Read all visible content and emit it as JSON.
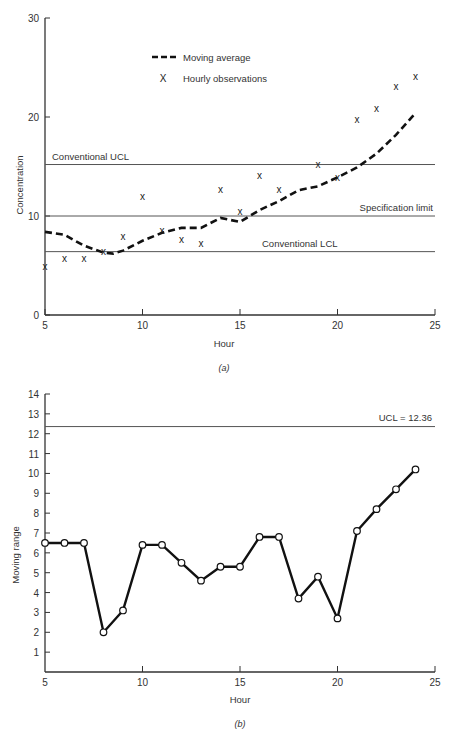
{
  "chart_data": [
    {
      "id": "a",
      "type": "line",
      "caption": "(a)",
      "xlabel": "Hour",
      "ylabel": "Concentration",
      "xlim": [
        5,
        25
      ],
      "ylim": [
        0,
        30
      ],
      "xticks": [
        5,
        10,
        15,
        20,
        25
      ],
      "yticks": [
        0,
        10,
        20,
        30
      ],
      "grid": false,
      "legend": {
        "position": "upper-left-center",
        "entries": [
          "Moving average",
          "Hourly observations"
        ]
      },
      "reference_lines": [
        {
          "label": "Conventional UCL",
          "y": 15.2
        },
        {
          "label": "Specification limit",
          "y": 10
        },
        {
          "label": "Conventional LCL",
          "y": 6.4
        }
      ],
      "series": [
        {
          "name": "Hourly observations",
          "style": "x-marker",
          "x": [
            5,
            6,
            7,
            8,
            9,
            10,
            11,
            12,
            13,
            14,
            15,
            16,
            17,
            19,
            20,
            21,
            22,
            23,
            24
          ],
          "values": [
            5.0,
            5.8,
            5.8,
            6.5,
            8.0,
            12.0,
            8.6,
            7.7,
            7.3,
            12.7,
            10.5,
            14.1,
            12.7,
            15.3,
            13.9,
            19.8,
            20.9,
            23.1,
            24.1
          ]
        },
        {
          "name": "Moving average",
          "style": "dashed",
          "x": [
            5,
            6,
            7,
            8,
            8.5,
            9,
            10,
            11,
            12,
            13,
            14,
            15,
            16,
            17,
            18,
            19,
            20,
            21,
            22,
            23,
            24
          ],
          "values": [
            8.4,
            8.1,
            7.0,
            6.3,
            6.2,
            6.5,
            7.5,
            8.3,
            8.8,
            8.8,
            9.8,
            9.4,
            10.6,
            11.5,
            12.6,
            13.0,
            13.9,
            14.9,
            16.3,
            18.2,
            20.4
          ]
        }
      ]
    },
    {
      "id": "b",
      "type": "line",
      "caption": "(b)",
      "xlabel": "Hour",
      "ylabel": "Moving range",
      "xlim": [
        5,
        25
      ],
      "ylim": [
        0,
        14
      ],
      "xticks": [
        5,
        10,
        15,
        20,
        25
      ],
      "yticks": [
        1,
        2,
        3,
        4,
        5,
        6,
        7,
        8,
        9,
        10,
        11,
        12,
        13,
        14
      ],
      "grid": false,
      "reference_lines": [
        {
          "label": "UCL = 12.36",
          "y": 12.36
        }
      ],
      "series": [
        {
          "name": "Moving range",
          "style": "solid-open-circles",
          "x": [
            5,
            6,
            7,
            8,
            9,
            10,
            11,
            12,
            13,
            14,
            15,
            16,
            17,
            18,
            19,
            20,
            21,
            22,
            23,
            24
          ],
          "values": [
            6.5,
            6.5,
            6.5,
            2.0,
            3.1,
            6.4,
            6.4,
            5.5,
            4.6,
            5.3,
            5.3,
            6.8,
            6.8,
            3.7,
            4.8,
            2.7,
            7.1,
            8.2,
            9.2,
            10.2
          ]
        }
      ]
    }
  ]
}
